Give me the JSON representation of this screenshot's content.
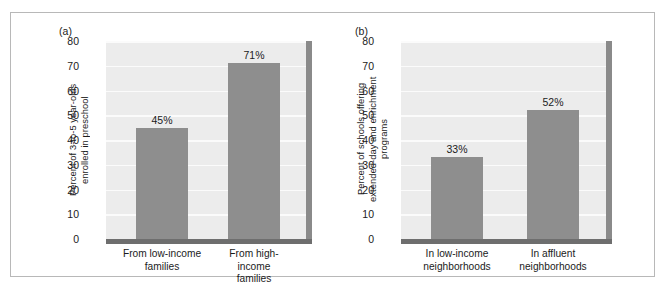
{
  "figure": {
    "border_color": "#b8b8b8",
    "background": "#ffffff"
  },
  "chart_data": [
    {
      "type": "bar",
      "panel_label": "(a)",
      "title": "",
      "xlabel": "",
      "ylabel": "Percent of 3-to-5 year-olds\nenrolled in preschool",
      "categories": [
        "From low-income\nfamilies",
        "From high-income\nfamilies"
      ],
      "values": [
        45,
        71
      ],
      "value_labels": [
        "45%",
        "71%"
      ],
      "ylim": [
        0,
        80
      ],
      "yticks": [
        0,
        10,
        20,
        30,
        40,
        50,
        60,
        70,
        80
      ],
      "ytick_labels": [
        "0",
        "10",
        "20",
        "30",
        "40",
        "50",
        "60",
        "70",
        "80"
      ],
      "grid": true,
      "legend": "none",
      "bar_color": "#8e8e8e",
      "plot_background": "#ececec"
    },
    {
      "type": "bar",
      "panel_label": "(b)",
      "title": "",
      "xlabel": "",
      "ylabel": "Percent of schools offering\nextended-day and enrichment\nprograms",
      "categories": [
        "In low-income\nneighborhoods",
        "In affluent\nneighborhoods"
      ],
      "values": [
        33,
        52
      ],
      "value_labels": [
        "33%",
        "52%"
      ],
      "ylim": [
        0,
        80
      ],
      "yticks": [
        0,
        10,
        20,
        30,
        40,
        50,
        60,
        70,
        80
      ],
      "ytick_labels": [
        "0",
        "10",
        "20",
        "30",
        "40",
        "50",
        "60",
        "70",
        "80"
      ],
      "grid": true,
      "legend": "none",
      "bar_color": "#8e8e8e",
      "plot_background": "#ececec"
    }
  ]
}
